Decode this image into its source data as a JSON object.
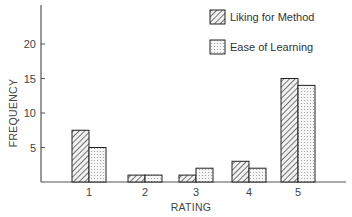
{
  "chart_data": {
    "type": "bar",
    "title": "",
    "xlabel": "RATING",
    "ylabel": "FREQUENCY",
    "categories": [
      "1",
      "2",
      "3",
      "4",
      "5"
    ],
    "series": [
      {
        "name": "Liking for Method",
        "pattern": "hatched",
        "values": [
          7.5,
          1,
          1,
          3,
          15
        ]
      },
      {
        "name": "Ease of Learning",
        "pattern": "dotted",
        "values": [
          5,
          1,
          2,
          2,
          14
        ]
      }
    ],
    "yticks": [
      5,
      10,
      15,
      20
    ],
    "ylim": [
      0,
      25
    ],
    "grid": false,
    "legend_position": "top-right"
  },
  "colors": {
    "axis": "#555555",
    "bar_outline": "#222222",
    "hatch": "#555555",
    "dot": "#999999"
  }
}
